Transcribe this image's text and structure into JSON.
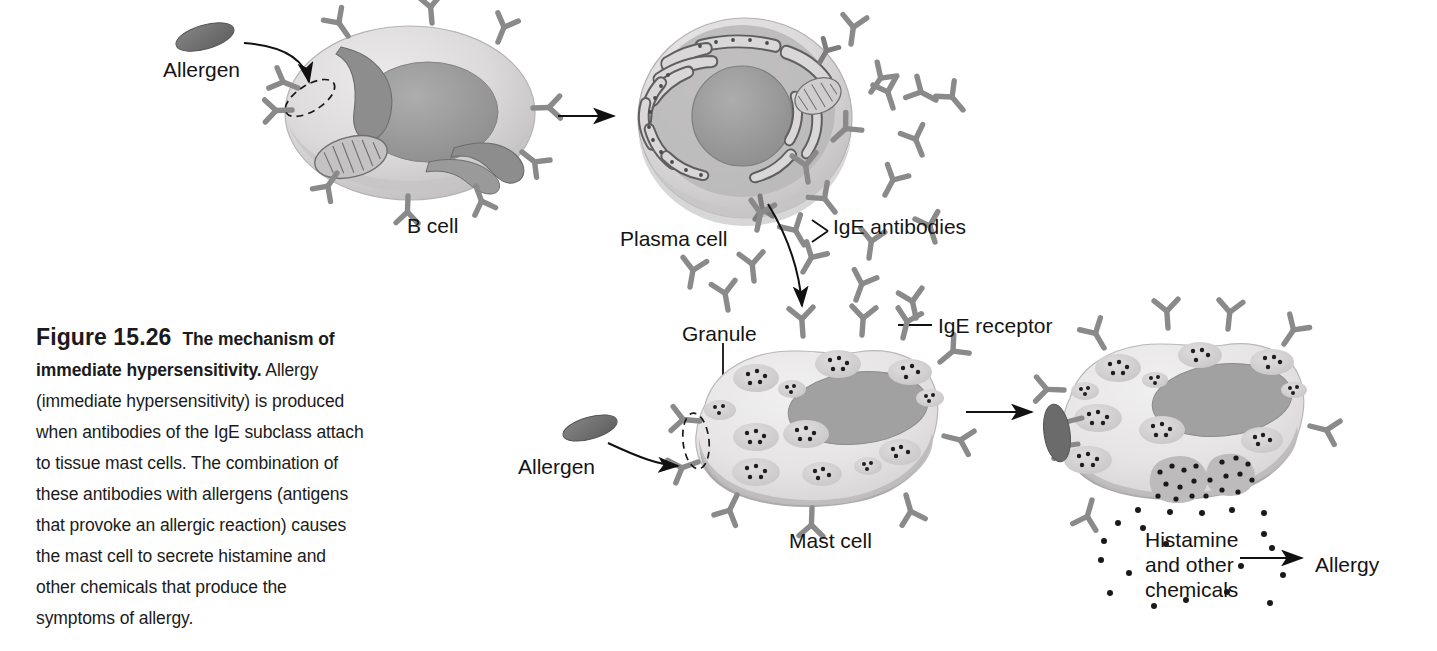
{
  "figure": {
    "number": "Figure 15.26",
    "title": "The mechanism of immediate hypersensitivity.",
    "caption_body": "Allergy (immediate hypersensitivity) is produced when antibodies of the IgE subclass attach to tissue mast cells. The combination of these antibodies with allergens (antigens that provoke an allergic reaction) causes the mast cell to secrete histamine and other chemicals that produce the symptoms of allergy.",
    "caption_lines": [
      "The mechanism of",
      "immediate hypersensitivity. Allergy",
      "(immediate hypersensitivity) is produced",
      "when antibodies of the IgE subclass attach",
      "to tissue mast cells. The combination of",
      "these antibodies with allergens (antigens",
      "that provoke an allergic reaction) causes",
      "the mast cell to secrete histamine and",
      "other chemicals that produce the",
      "symptoms of allergy."
    ]
  },
  "labels": {
    "allergen_top": "Allergen",
    "b_cell": "B cell",
    "plasma_cell": "Plasma cell",
    "ige_antibodies": "IgE antibodies",
    "granule": "Granule",
    "ige_receptor": "IgE receptor",
    "allergen_bottom": "Allergen",
    "mast_cell": "Mast cell",
    "histamine": "Histamine and other chemicals",
    "histamine_l1": "Histamine",
    "histamine_l2": "and other",
    "histamine_l3": "chemicals",
    "allergy": "Allergy"
  },
  "colors": {
    "cytoplasm_light": "#e2e2e2",
    "cytoplasm_mid": "#cfcfcf",
    "cytoplasm_shadow": "#b4b4b4",
    "nucleus": "#9a9a9a",
    "nucleus_dark": "#8d8d8d",
    "organelle": "#8f8f8f",
    "organelle_dark": "#6f6f6f",
    "allergen": "#6e6e6e",
    "antibody": "#8a8a8a",
    "granule_fill": "#d6d6d6",
    "granule_dot": "#1e1e1e",
    "line": "#111111",
    "text": "#141414",
    "background": "#ffffff"
  },
  "diagram": {
    "type": "biological-process-flow",
    "stages": [
      {
        "id": "b-cell",
        "label": "B cell",
        "organelles": [
          "nucleus",
          "mitochondrion",
          "endoplasmic reticulum"
        ],
        "surface": "IgE-type receptors"
      },
      {
        "id": "plasma-cell",
        "label": "Plasma cell",
        "organelles": [
          "nucleus",
          "rough endoplasmic reticulum",
          "mitochondrion"
        ],
        "secretes": "IgE antibodies"
      },
      {
        "id": "mast-cell",
        "label": "Mast cell",
        "organelles": [
          "nucleus",
          "granules"
        ],
        "surface": "IgE receptors"
      },
      {
        "id": "mast-cell-degranulating",
        "label": "Mast cell degranulating",
        "releases": "Histamine and other chemicals"
      }
    ],
    "flow_arrows": [
      {
        "from": "Allergen",
        "to": "B cell receptor"
      },
      {
        "from": "B cell",
        "to": "Plasma cell"
      },
      {
        "from": "Plasma cell IgE antibodies",
        "to": "Mast cell"
      },
      {
        "from": "Allergen",
        "to": "Mast cell receptor"
      },
      {
        "from": "Mast cell",
        "to": "Mast cell degranulating"
      },
      {
        "from": "Histamine and other chemicals",
        "to": "Allergy"
      }
    ]
  }
}
